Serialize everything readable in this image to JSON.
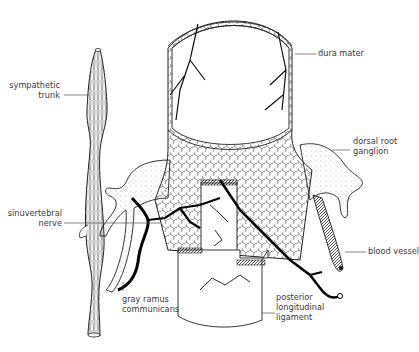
{
  "figure": {
    "type": "anatomical-illustration",
    "colors": {
      "line": "#1a1a1a",
      "background": "#ffffff",
      "label_text": "#3a3a3a",
      "leader": "#555555"
    }
  },
  "labels": {
    "sympathetic_trunk": {
      "line1": "sympathetic",
      "line2": "trunk"
    },
    "dura_mater": {
      "line1": "dura mater"
    },
    "dorsal_root_ganglion": {
      "line1": "dorsal root",
      "line2": "ganglion"
    },
    "sinuvertebral_nerve": {
      "line1": "sinuvertebral",
      "line2": "nerve"
    },
    "blood_vessel": {
      "line1": "blood vessel"
    },
    "gray_ramus_communicans": {
      "line1": "gray ramus",
      "line2": "communicans"
    },
    "posterior_longitudinal_ligament": {
      "line1": "posterior",
      "line2": "longitudinal",
      "line3": "ligament"
    }
  }
}
